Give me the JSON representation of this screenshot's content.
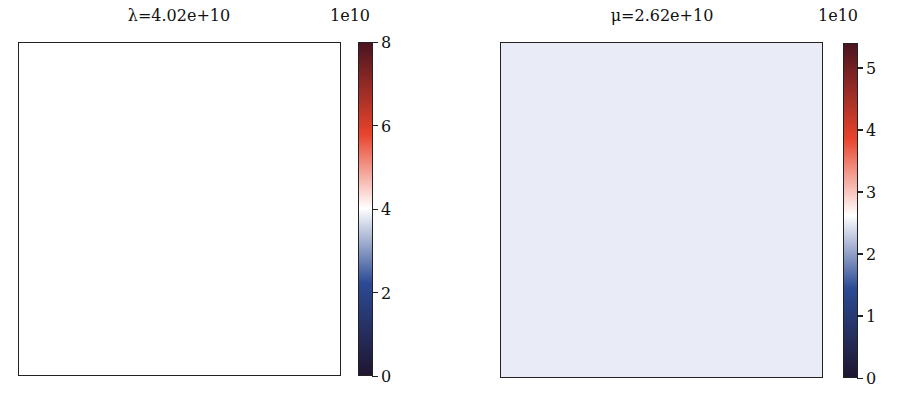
{
  "chart_data": [
    {
      "type": "heatmap",
      "title": "λ=4.02e+10",
      "title_symbol": "λ",
      "title_value": "4.02e+10",
      "field_value": 40200000000.0,
      "fill_color": "#ffffff",
      "colorbar": {
        "offset_label": "1e10",
        "vmin": 0,
        "vmax": 8,
        "ticks": [
          0,
          2,
          4,
          6,
          8
        ],
        "tick_labels": [
          "0",
          "2",
          "4",
          "6",
          "8"
        ],
        "colormap": "diverging dark-blue → white → dark-red",
        "center": 4.02
      },
      "xlabel": "",
      "ylabel": "",
      "axes_ticks": false
    },
    {
      "type": "heatmap",
      "title": "μ=2.62e+10",
      "title_symbol": "μ",
      "title_value": "2.62e+10",
      "field_value": 26200000000.0,
      "fill_color": "#e9ecf6",
      "colorbar": {
        "offset_label": "1e10",
        "vmin": 0,
        "vmax": 5.4,
        "ticks": [
          0,
          1,
          2,
          3,
          4,
          5
        ],
        "tick_labels": [
          "0",
          "1",
          "2",
          "3",
          "4",
          "5"
        ],
        "colormap": "diverging dark-blue → white → dark-red",
        "center": 2.62
      },
      "xlabel": "",
      "ylabel": "",
      "axes_ticks": false
    }
  ],
  "colors": {
    "cmap_low": "#1f1630",
    "cmap_blue": "#2c4a94",
    "cmap_white": "#ffffff",
    "cmap_red": "#e8432b",
    "cmap_high": "#4a1420"
  }
}
